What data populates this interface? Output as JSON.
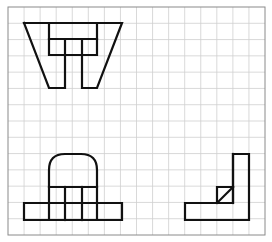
{
  "diagram": {
    "type": "orthographic-projection-three-views",
    "grid": {
      "columns": 16,
      "rows": 14,
      "frame": {
        "x": 8,
        "y": 7,
        "width": 257,
        "height": 228
      },
      "line_color": "#cfcfcf",
      "frame_color": "#8a8a8a"
    },
    "stroke_color": "#111111",
    "views": [
      {
        "name": "top-view",
        "description": "Trapezoid outline with inner rectangle and two downward legs",
        "segments": [
          "M24,23 L122,23 L97,88 L82,88 L82,39",
          "M24,23 L49,88 L65,88 L65,39",
          "M49,23 L49,55 L97,55 L97,23",
          "M49,39 L97,39"
        ]
      },
      {
        "name": "front-view",
        "description": "Arched upright on a wide rectangular base",
        "segments": [
          "M49,220 L49,170 Q49,154 65,154 L81,154 Q97,154 97,170 L97,220",
          "M49,187 L97,187",
          "M65,187 L65,220",
          "M82,187 L82,220",
          "M24,203 L122,203 L122,220 L24,220 Z"
        ]
      },
      {
        "name": "side-view",
        "description": "L-shaped profile with a triangular gusset",
        "segments": [
          "M233,154 L249,154 L249,220 L185,220 L185,203 L233,203 Z",
          "M233,154 L233,203",
          "M217,203 L217,187 L233,187",
          "M217,203 L233,187"
        ]
      }
    ]
  }
}
